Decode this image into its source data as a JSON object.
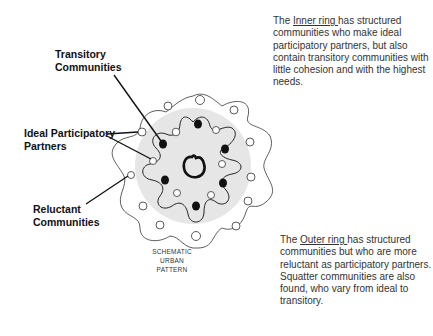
{
  "labels": {
    "transitory": [
      "Transitory",
      "Communities"
    ],
    "ideal": [
      "Ideal Participatory",
      "Partners"
    ],
    "reluctant": [
      "Reluctant",
      "Communities"
    ]
  },
  "caption": [
    "SCHEMATIC",
    "URBAN",
    "PATTERN"
  ],
  "inner_note": {
    "prefix": "The ",
    "term": "Inner ring ",
    "text": "has structured communities who make ideal participatory partners, but also contain transitory communities with little cohesion and with the highest needs."
  },
  "outer_note": {
    "prefix": "The ",
    "term": "Outer ring ",
    "text": "has structured communities but who are more reluctant as participatory partners.",
    "text2": "Squatter communities are also found, who vary from ideal to transitory."
  },
  "colors": {
    "inner_fill": "#e6e6e6",
    "stroke": "#222222",
    "text": "#333333"
  }
}
